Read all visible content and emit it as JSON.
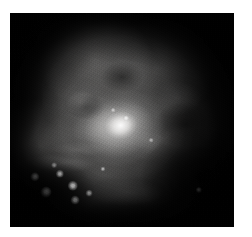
{
  "page": {
    "background_color": "#ffffff",
    "width": 252,
    "height": 237
  },
  "image_plate": {
    "label": "Astronomical nebula photograph",
    "description": "Grayscale deep-sky image of an emission nebula with a bright diagonal core ridge, dark absorption lanes, and a group of foreground point stars in the lower-left quadrant.",
    "subject": "nebula",
    "rendering": "grayscale",
    "background_color": "#050505",
    "bounds": {
      "left": 10,
      "top": 13,
      "width": 224,
      "height": 214
    }
  },
  "nebula": {
    "core": {
      "label": "bright core knot",
      "center_pct": {
        "x": 50,
        "y": 52
      },
      "peak_color": "#ffffff"
    },
    "ridge": {
      "label": "diagonal bright ridge",
      "orientation_deg": -14
    },
    "dark_lanes": [
      {
        "name": "lower-left-bay",
        "center_pct": {
          "x": 16,
          "y": 84
        }
      },
      {
        "name": "lower-right-wedge",
        "center_pct": {
          "x": 86,
          "y": 76
        }
      },
      {
        "name": "right-of-core-notch",
        "center_pct": {
          "x": 78,
          "y": 52
        }
      },
      {
        "name": "upper-middle-lane",
        "center_pct": {
          "x": 50,
          "y": 30
        }
      }
    ]
  },
  "stars": [
    {
      "name": "star-1",
      "x_pct": 11.2,
      "y_pct": 76.5,
      "size": 3.6,
      "brightness": 0.92
    },
    {
      "name": "star-2",
      "x_pct": 16.0,
      "y_pct": 83.6,
      "size": 4.2,
      "brightness": 1.0
    },
    {
      "name": "star-3",
      "x_pct": 22.3,
      "y_pct": 75.2,
      "size": 3.2,
      "brightness": 0.86
    },
    {
      "name": "star-4",
      "x_pct": 28.1,
      "y_pct": 80.8,
      "size": 4.0,
      "brightness": 0.96
    },
    {
      "name": "star-5",
      "x_pct": 29.0,
      "y_pct": 87.4,
      "size": 3.4,
      "brightness": 0.88
    },
    {
      "name": "star-6",
      "x_pct": 35.3,
      "y_pct": 84.1,
      "size": 2.6,
      "brightness": 0.72
    },
    {
      "name": "star-7",
      "x_pct": 19.6,
      "y_pct": 71.0,
      "size": 2.2,
      "brightness": 0.6
    },
    {
      "name": "star-8",
      "x_pct": 41.5,
      "y_pct": 72.9,
      "size": 2.0,
      "brightness": 0.55
    },
    {
      "name": "star-9",
      "x_pct": 84.2,
      "y_pct": 82.7,
      "size": 2.4,
      "brightness": 0.58
    },
    {
      "name": "star-10",
      "x_pct": 52.0,
      "y_pct": 49.0,
      "size": 2.2,
      "brightness": 0.64
    },
    {
      "name": "star-11",
      "x_pct": 46.0,
      "y_pct": 45.5,
      "size": 1.8,
      "brightness": 0.52
    },
    {
      "name": "star-12",
      "x_pct": 63.0,
      "y_pct": 59.5,
      "size": 1.8,
      "brightness": 0.48
    }
  ]
}
